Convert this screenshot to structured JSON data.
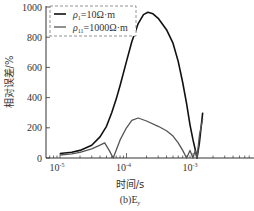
{
  "chart_data": {
    "type": "line",
    "title": "",
    "caption": "(b)E",
    "caption_subscript": "y",
    "xlabel": "时间/s",
    "ylabel": "相对误差/%",
    "xscale": "log",
    "xlim": [
      7e-06,
      0.008
    ],
    "ylim": [
      0,
      1000
    ],
    "x_ticks": [
      {
        "value": 1e-05,
        "base": "10",
        "exp": "-5"
      },
      {
        "value": 0.0001,
        "base": "10",
        "exp": "-4"
      },
      {
        "value": 0.001,
        "base": "10",
        "exp": "-3"
      }
    ],
    "y_ticks": [
      0,
      200,
      400,
      600,
      800,
      1000
    ],
    "grid": false,
    "legend_position": "upper-left",
    "series": [
      {
        "name": "ρ1=10Ω·m",
        "legend_rho": "ρ",
        "legend_sub": "1",
        "legend_value": "=10Ω·m",
        "color": "#111111",
        "width": 1.6,
        "points": [
          [
            1e-05,
            30
          ],
          [
            1.5e-05,
            38
          ],
          [
            2e-05,
            50
          ],
          [
            3e-05,
            85
          ],
          [
            4e-05,
            140
          ],
          [
            5e-05,
            210
          ],
          [
            6e-05,
            300
          ],
          [
            7e-05,
            390
          ],
          [
            8e-05,
            480
          ],
          [
            0.0001,
            640
          ],
          [
            0.00012,
            770
          ],
          [
            0.00015,
            890
          ],
          [
            0.00018,
            950
          ],
          [
            0.00021,
            965
          ],
          [
            0.00025,
            955
          ],
          [
            0.0003,
            925
          ],
          [
            0.0004,
            850
          ],
          [
            0.0005,
            760
          ],
          [
            0.0006,
            640
          ],
          [
            0.0007,
            500
          ],
          [
            0.0008,
            360
          ],
          [
            0.0009,
            220
          ],
          [
            0.001,
            120
          ],
          [
            0.0011,
            40
          ],
          [
            0.00115,
            0
          ],
          [
            0.00125,
            100
          ],
          [
            0.0014,
            300
          ]
        ]
      },
      {
        "name": "ρ11=1000Ω·m",
        "legend_rho": "ρ",
        "legend_sub": "11",
        "legend_value": "=1000Ω·m",
        "color": "#555555",
        "width": 1.3,
        "points": [
          [
            1e-05,
            20
          ],
          [
            1.5e-05,
            28
          ],
          [
            2e-05,
            38
          ],
          [
            3e-05,
            60
          ],
          [
            4e-05,
            85
          ],
          [
            4.7e-05,
            100
          ],
          [
            5.5e-05,
            50
          ],
          [
            6.3e-05,
            0
          ],
          [
            8e-05,
            120
          ],
          [
            0.0001,
            200
          ],
          [
            0.00012,
            250
          ],
          [
            0.00015,
            265
          ],
          [
            0.0002,
            245
          ],
          [
            0.0003,
            210
          ],
          [
            0.0004,
            180
          ],
          [
            0.0005,
            145
          ],
          [
            0.0006,
            100
          ],
          [
            0.0007,
            50
          ],
          [
            0.0008,
            0
          ],
          [
            0.0009,
            50
          ],
          [
            0.001,
            0
          ],
          [
            0.00108,
            50
          ],
          [
            0.00115,
            0
          ],
          [
            0.00125,
            150
          ],
          [
            0.0014,
            260
          ]
        ]
      }
    ]
  }
}
